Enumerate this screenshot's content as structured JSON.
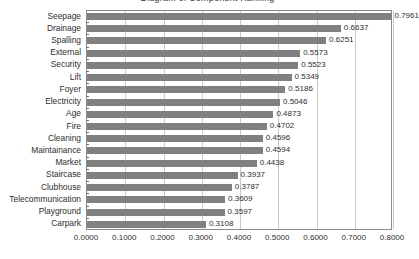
{
  "title": "Diagram of Component Ranking",
  "chart_data": {
    "type": "bar",
    "orientation": "horizontal",
    "title": "Diagram of Component Ranking",
    "xlabel": "",
    "ylabel": "",
    "xlim": [
      0.0,
      0.8
    ],
    "xticks": [
      "0.0000",
      "0.1000",
      "0.2000",
      "0.3000",
      "0.4000",
      "0.5000",
      "0.6000",
      "0.7000",
      "0.8000"
    ],
    "xtick_values": [
      0.0,
      0.1,
      0.2,
      0.3,
      0.4,
      0.5,
      0.6,
      0.7,
      0.8
    ],
    "grid": "vertical",
    "legend": "none",
    "bar_color": "#808080",
    "plot_background": "#ffffff",
    "categories": [
      "Seepage",
      "Drainage",
      "Spalling",
      "External",
      "Security",
      "Lift",
      "Foyer",
      "Electricity",
      "Age",
      "Fire",
      "Cleaning",
      "Maintainance",
      "Market",
      "Staircase",
      "Clubhouse",
      "Telecommunication",
      "Playground",
      "Carpark"
    ],
    "values": [
      0.7961,
      0.6637,
      0.6251,
      0.5573,
      0.5523,
      0.5349,
      0.5186,
      0.5046,
      0.4873,
      0.4702,
      0.4596,
      0.4594,
      0.4438,
      0.3937,
      0.3787,
      0.3609,
      0.3597,
      0.3108
    ],
    "value_labels": [
      "0.7961",
      "0.6637",
      "0.6251",
      "0.5573",
      "0.5523",
      "0.5349",
      "0.5186",
      "0.5046",
      "0.4873",
      "0.4702",
      "0.4596",
      "0.4594",
      "0.4438",
      "0.3937",
      "0.3787",
      "0.3609",
      "0.3597",
      "0.3108"
    ]
  }
}
